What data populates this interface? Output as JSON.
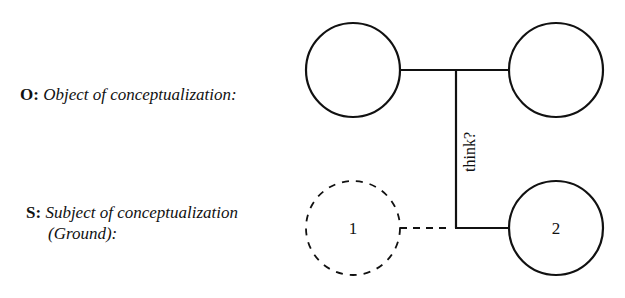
{
  "labels": {
    "object": {
      "prefix": "O:",
      "text": "Object of conceptualization:"
    },
    "subject": {
      "prefix": "S:",
      "text_line1": "Subject of conceptualization",
      "text_line2": "(Ground):"
    }
  },
  "diagram": {
    "relation_label": "think?",
    "nodes": [
      {
        "id": "object-left",
        "label": "",
        "style": "solid"
      },
      {
        "id": "object-right",
        "label": "",
        "style": "solid"
      },
      {
        "id": "subject-ground",
        "label": "1",
        "style": "dashed"
      },
      {
        "id": "subject-2",
        "label": "2",
        "style": "solid"
      }
    ],
    "stroke_color": "#111111"
  }
}
